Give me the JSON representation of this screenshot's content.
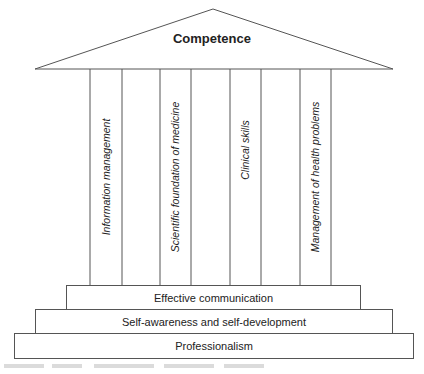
{
  "roof": {
    "title": "Competence"
  },
  "pillars": [
    {
      "label": "Information management"
    },
    {
      "label": "Scientific foundation of medicine"
    },
    {
      "label": "Clinical skills"
    },
    {
      "label": "Management of health problems"
    }
  ],
  "steps": [
    {
      "label": "Effective communication"
    },
    {
      "label": "Self-awareness and self-development"
    },
    {
      "label": "Professionalism"
    }
  ]
}
